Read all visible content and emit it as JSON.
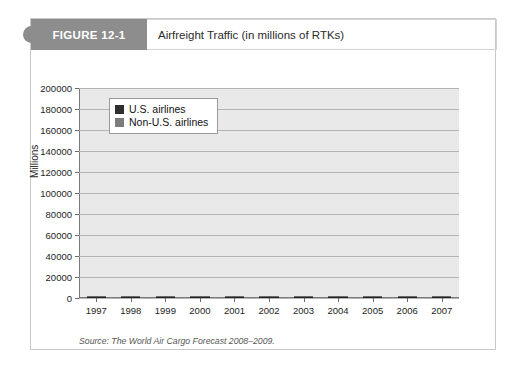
{
  "figure": {
    "tab_label": "FIGURE 12-1",
    "caption": "Airfreight Traffic (in millions of RTKs)",
    "source_note": "Source: The World Air Cargo Forecast 2008–2009."
  },
  "colors": {
    "tab_background": "#8d8d8d",
    "plot_background": "#e9e9e9",
    "gridline": "#b4b4b4",
    "us_airlines": "#2f2f2f",
    "non_us_airlines": "#7c7c7c",
    "axis": "#7a7a7a",
    "frame_border": "#c9c9c9"
  },
  "chart_data": {
    "type": "bar",
    "stacked": true,
    "title": "Airfreight Traffic (in millions of RTKs)",
    "xlabel": "",
    "ylabel": "Millions",
    "ylim": [
      0,
      200000
    ],
    "ytick_step": 20000,
    "yticks": [
      0,
      20000,
      40000,
      60000,
      80000,
      100000,
      120000,
      140000,
      160000,
      180000,
      200000
    ],
    "ytick_labels": [
      "0",
      "20000",
      "40000",
      "60000",
      "80000",
      "100000",
      "120000",
      "140000",
      "160000",
      "180000",
      "200000"
    ],
    "grid": true,
    "legend_position": "upper-left-inside",
    "categories": [
      "1997",
      "1998",
      "1999",
      "2000",
      "2001",
      "2002",
      "2003",
      "2004",
      "2005",
      "2006",
      "2007"
    ],
    "series": [
      {
        "name": "U.S. airlines",
        "color": "#2f2f2f",
        "values": [
          40000,
          40500,
          42000,
          44000,
          41500,
          42500,
          43500,
          45500,
          46000,
          47000,
          47500
        ]
      },
      {
        "name": "Non-U.S. airlines",
        "color": "#7c7c7c",
        "values": [
          89000,
          88500,
          96000,
          105000,
          99000,
          109000,
          111500,
          131500,
          134000,
          138000,
          146500
        ]
      }
    ],
    "totals": [
      129000,
      129000,
      138000,
      149000,
      140500,
      151500,
      155000,
      177000,
      180000,
      185000,
      194000
    ]
  }
}
